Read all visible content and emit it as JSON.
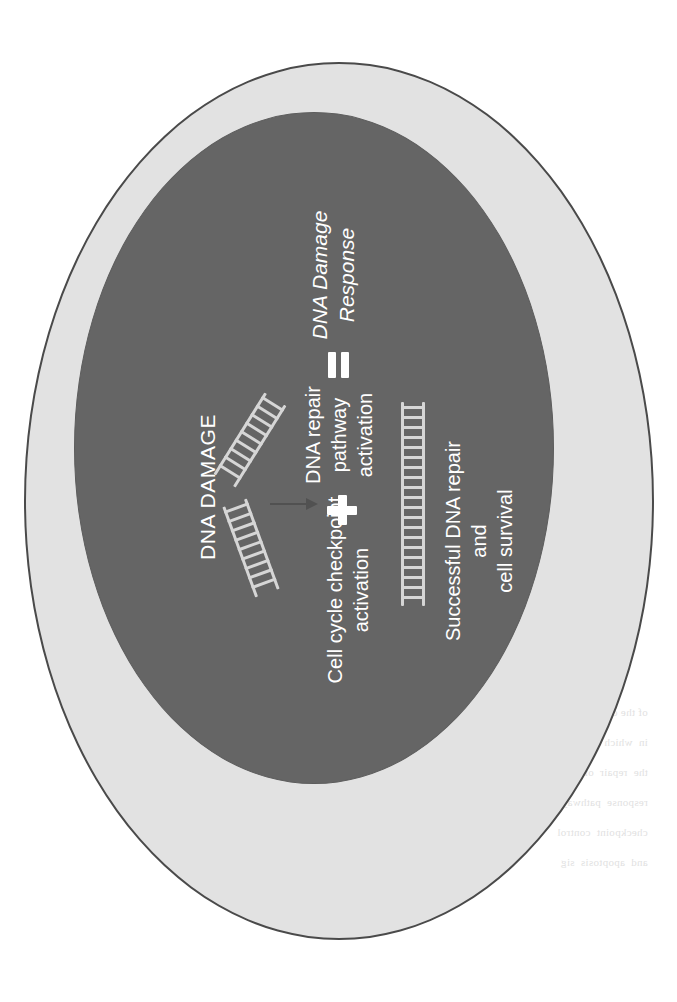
{
  "diagram": {
    "type": "biological-schematic",
    "background_color": "#ffffff"
  },
  "cell": {
    "name": "cell",
    "fill_color": "#e2e2e2",
    "border_color": "#4a4a4a"
  },
  "nucleus": {
    "name": "nucleus",
    "fill_color": "#656565"
  },
  "labels": {
    "dna_damage": "DNA DAMAGE",
    "cell_cycle_checkpoint": "Cell cycle checkpoint\nactivation",
    "dna_repair_pathway": "DNA repair\npathway\nactivation",
    "dna_damage_response": "DNA Damage\nResponse",
    "successful_repair": "Successful DNA repair\nand\ncell survival"
  },
  "symbols": {
    "plus": "+",
    "equals": "=",
    "arrow": "→"
  },
  "text_color": "#ffffff",
  "dna_strand_color": "#d6d6d6",
  "bleed_through": {
    "note": "faint mirrored text bleeding through from the reverse side of the scanned page",
    "blocks": [
      "of the cell is  a  proce",
      "in  which  DNA  dam",
      "the  repair  of  lesion",
      "response  pathways",
      "checkpoint  control",
      "and  apoptosis  sig"
    ]
  }
}
